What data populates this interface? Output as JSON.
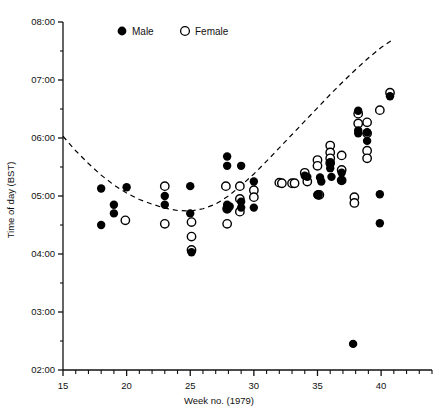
{
  "chart_data": {
    "type": "scatter",
    "title": "",
    "xlabel": "Week no. (1979)",
    "ylabel": "Time of day (BST)",
    "xlim": [
      15,
      44
    ],
    "ylim_hours": [
      2,
      8
    ],
    "xticks": [
      15,
      20,
      25,
      30,
      35,
      40
    ],
    "xtick_labels": [
      "15",
      "20",
      "25",
      "30",
      "35",
      "40"
    ],
    "x_minor_tick_step": 1,
    "yticks": [
      2,
      3,
      4,
      5,
      6,
      7,
      8
    ],
    "ytick_labels": [
      "02:00",
      "03:00",
      "04:00",
      "05:00",
      "06:00",
      "07:00",
      "08:00"
    ],
    "y_minor_tick_step": 0.5,
    "grid": false,
    "legend_position": "top-center",
    "legend": [
      {
        "name": "Male",
        "marker": "filled-circle",
        "color": "#000000"
      },
      {
        "name": "Female",
        "marker": "open-circle",
        "color": "#000000"
      }
    ],
    "series": [
      {
        "name": "Male",
        "marker": "filled-circle",
        "points": [
          [
            18.0,
            5.13
          ],
          [
            18.0,
            4.5
          ],
          [
            19.0,
            4.85
          ],
          [
            19.0,
            4.7
          ],
          [
            20.0,
            5.15
          ],
          [
            23.0,
            5.0
          ],
          [
            23.0,
            4.85
          ],
          [
            25.0,
            5.17
          ],
          [
            25.0,
            4.7
          ],
          [
            25.1,
            4.03
          ],
          [
            27.9,
            5.68
          ],
          [
            27.9,
            5.52
          ],
          [
            27.9,
            4.85
          ],
          [
            27.9,
            4.78
          ],
          [
            28.1,
            4.82
          ],
          [
            29.0,
            5.52
          ],
          [
            29.0,
            4.9
          ],
          [
            29.0,
            4.8
          ],
          [
            30.0,
            5.25
          ],
          [
            30.0,
            4.8
          ],
          [
            34.0,
            5.35
          ],
          [
            34.2,
            5.33
          ],
          [
            35.0,
            5.02
          ],
          [
            35.1,
            5.02
          ],
          [
            35.2,
            5.32
          ],
          [
            35.3,
            5.25
          ],
          [
            36.0,
            5.57
          ],
          [
            36.0,
            5.48
          ],
          [
            36.1,
            5.33
          ],
          [
            36.9,
            5.4
          ],
          [
            36.9,
            5.27
          ],
          [
            37.8,
            2.45
          ],
          [
            38.2,
            6.47
          ],
          [
            38.2,
            6.13
          ],
          [
            38.2,
            6.08
          ],
          [
            38.9,
            6.1
          ],
          [
            38.9,
            5.95
          ],
          [
            39.9,
            5.03
          ],
          [
            39.9,
            4.53
          ],
          [
            40.7,
            6.72
          ]
        ]
      },
      {
        "name": "Female",
        "marker": "open-circle",
        "points": [
          [
            19.9,
            4.58
          ],
          [
            23.0,
            5.17
          ],
          [
            23.0,
            4.52
          ],
          [
            25.1,
            4.55
          ],
          [
            25.1,
            4.3
          ],
          [
            25.1,
            4.07
          ],
          [
            27.8,
            5.17
          ],
          [
            27.9,
            4.78
          ],
          [
            27.9,
            4.52
          ],
          [
            28.9,
            5.17
          ],
          [
            28.9,
            4.95
          ],
          [
            28.9,
            4.73
          ],
          [
            30.0,
            5.1
          ],
          [
            30.0,
            4.98
          ],
          [
            32.0,
            5.23
          ],
          [
            32.2,
            5.22
          ],
          [
            33.0,
            5.22
          ],
          [
            33.2,
            5.22
          ],
          [
            34.0,
            5.4
          ],
          [
            34.2,
            5.25
          ],
          [
            35.0,
            5.62
          ],
          [
            35.0,
            5.52
          ],
          [
            35.05,
            5.02
          ],
          [
            35.15,
            5.02
          ],
          [
            36.0,
            5.87
          ],
          [
            36.0,
            5.75
          ],
          [
            36.0,
            5.65
          ],
          [
            36.0,
            5.57
          ],
          [
            36.9,
            5.7
          ],
          [
            36.9,
            5.45
          ],
          [
            36.9,
            5.27
          ],
          [
            37.9,
            4.98
          ],
          [
            37.9,
            4.88
          ],
          [
            38.2,
            6.42
          ],
          [
            38.2,
            6.25
          ],
          [
            38.9,
            6.27
          ],
          [
            38.9,
            6.08
          ],
          [
            38.9,
            5.78
          ],
          [
            38.9,
            5.65
          ],
          [
            39.9,
            6.48
          ],
          [
            40.7,
            6.78
          ]
        ]
      }
    ],
    "trend_curve": {
      "style": "dashed",
      "color": "#000000",
      "description": "U-shaped fitted curve with minimum near week 25",
      "points": [
        [
          15.0,
          6.03
        ],
        [
          16.0,
          5.78
        ],
        [
          17.0,
          5.56
        ],
        [
          18.0,
          5.36
        ],
        [
          19.0,
          5.19
        ],
        [
          20.0,
          5.05
        ],
        [
          21.0,
          4.94
        ],
        [
          22.0,
          4.86
        ],
        [
          23.0,
          4.79
        ],
        [
          24.0,
          4.75
        ],
        [
          25.0,
          4.74
        ],
        [
          26.0,
          4.78
        ],
        [
          27.0,
          4.86
        ],
        [
          28.0,
          5.0
        ],
        [
          29.0,
          5.18
        ],
        [
          30.0,
          5.38
        ],
        [
          31.0,
          5.6
        ],
        [
          32.0,
          5.83
        ],
        [
          33.0,
          6.06
        ],
        [
          34.0,
          6.29
        ],
        [
          35.0,
          6.52
        ],
        [
          36.0,
          6.75
        ],
        [
          37.0,
          6.97
        ],
        [
          38.0,
          7.18
        ],
        [
          39.0,
          7.38
        ],
        [
          40.0,
          7.56
        ],
        [
          40.8,
          7.68
        ]
      ]
    }
  },
  "axes": {
    "x_title": "Week no. (1979)",
    "y_title": "Time of day (BST)"
  },
  "legend": {
    "male_label": "Male",
    "female_label": "Female"
  }
}
